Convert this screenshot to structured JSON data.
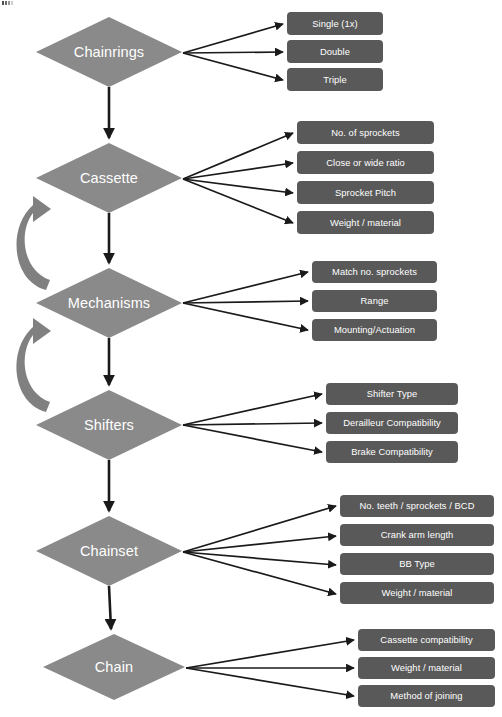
{
  "diagram": {
    "colors": {
      "node_fill": "#8a8a8a",
      "box_fill": "#595959",
      "arrow": "#1a1a1a",
      "loop_arrow": "#808080",
      "label_text": "#ffffff",
      "background": "#ffffff"
    },
    "nodes": [
      {
        "id": "chainrings",
        "label": "Chainrings",
        "shape": "diamond",
        "cx": 109,
        "cy": 52,
        "rx": 73,
        "ry": 35,
        "branch_x": 287,
        "branch_w": 96,
        "branches": [
          {
            "label": "Single (1x)",
            "y": 24
          },
          {
            "label": "Double",
            "y": 52
          },
          {
            "label": "Triple",
            "y": 80
          }
        ]
      },
      {
        "id": "cassette",
        "label": "Cassette",
        "shape": "diamond",
        "cx": 109,
        "cy": 178,
        "rx": 73,
        "ry": 35,
        "branch_x": 297,
        "branch_w": 137,
        "branches": [
          {
            "label": "No. of sprockets",
            "y": 133
          },
          {
            "label": "Close or wide ratio",
            "y": 163
          },
          {
            "label": "Sprocket Pitch",
            "y": 193
          },
          {
            "label": "Weight / material",
            "y": 223
          }
        ]
      },
      {
        "id": "mechanisms",
        "label": "Mechanisms",
        "shape": "diamond",
        "cx": 109,
        "cy": 303,
        "rx": 73,
        "ry": 35,
        "branch_x": 312,
        "branch_w": 125,
        "branches": [
          {
            "label": "Match no. sprockets",
            "y": 272
          },
          {
            "label": "Range",
            "y": 301
          },
          {
            "label": "Mounting/Actuation",
            "y": 330
          }
        ]
      },
      {
        "id": "shifters",
        "label": "Shifters",
        "shape": "diamond",
        "cx": 109,
        "cy": 425,
        "rx": 73,
        "ry": 35,
        "branch_x": 326,
        "branch_w": 132,
        "branches": [
          {
            "label": "Shifter Type",
            "y": 394
          },
          {
            "label": "Derailleur Compatibility",
            "y": 423
          },
          {
            "label": "Brake Compatibility",
            "y": 452
          }
        ]
      },
      {
        "id": "chainset",
        "label": "Chainset",
        "shape": "diamond",
        "cx": 109,
        "cy": 551,
        "rx": 73,
        "ry": 35,
        "branch_x": 340,
        "branch_w": 154,
        "branches": [
          {
            "label": "No. teeth / sprockets / BCD",
            "y": 506
          },
          {
            "label": "Crank arm length",
            "y": 536
          },
          {
            "label": "BB Type",
            "y": 565
          },
          {
            "label": "Weight / material",
            "y": 594
          }
        ]
      },
      {
        "id": "chain",
        "label": "Chain",
        "shape": "diamond",
        "cx": 114,
        "cy": 667,
        "rx": 71,
        "ry": 33,
        "branch_x": 358,
        "branch_w": 137,
        "branches": [
          {
            "label": "Cassette compatibility",
            "y": 640
          },
          {
            "label": "Weight / material",
            "y": 668
          },
          {
            "label": "Method of joining",
            "y": 696
          }
        ]
      }
    ],
    "flow_connectors": [
      {
        "from": "chainrings",
        "to": "cassette"
      },
      {
        "from": "cassette",
        "to": "mechanisms"
      },
      {
        "from": "mechanisms",
        "to": "shifters"
      },
      {
        "from": "shifters",
        "to": "chainset"
      },
      {
        "from": "chainset",
        "to": "chain"
      }
    ],
    "feedback_loops": [
      {
        "from": "mechanisms",
        "to": "cassette",
        "side": "left"
      },
      {
        "from": "shifters",
        "to": "mechanisms",
        "side": "left"
      }
    ]
  }
}
